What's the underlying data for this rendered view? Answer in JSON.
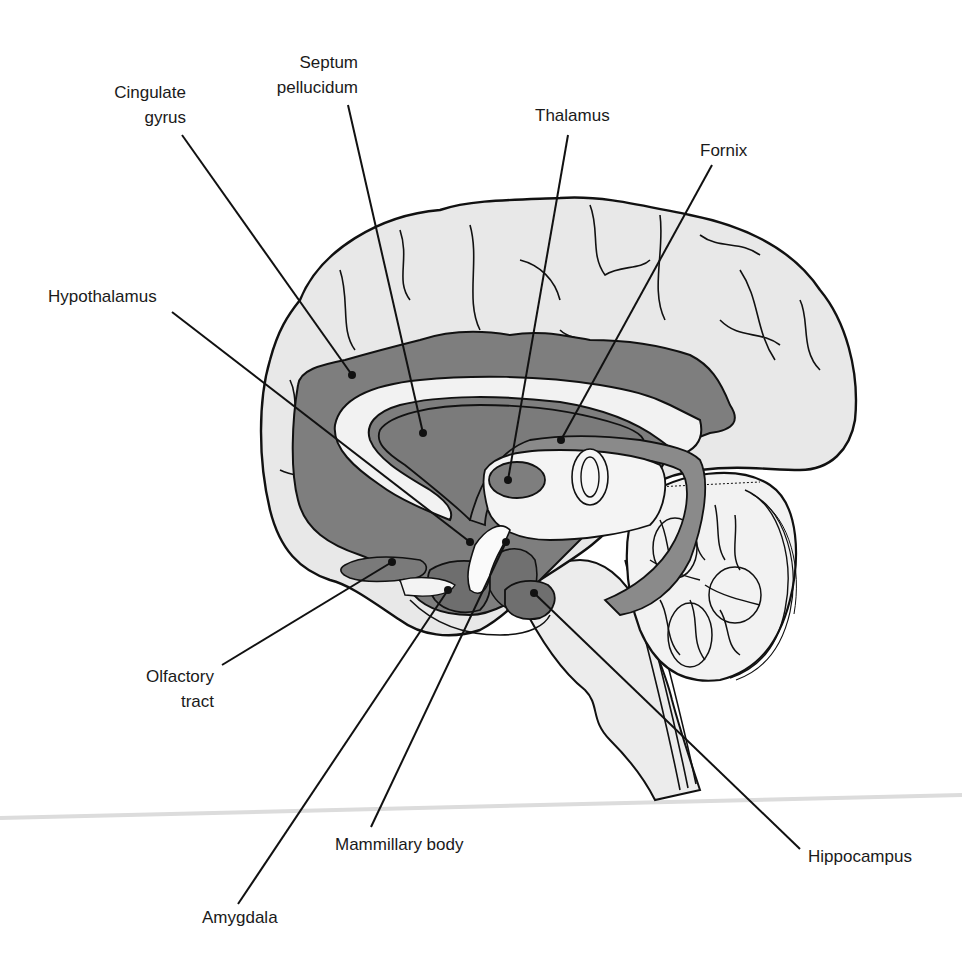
{
  "diagram": {
    "colors": {
      "cortex_fill": "#e6e6e6",
      "limbic_fill": "#7d7d7d",
      "limbic_dark": "#6a6a6a",
      "light_band": "#f2f2f2",
      "stroke": "#111111",
      "cerebellum_fill": "#f0f0f0",
      "brainstem_fill": "#ebebeb",
      "rule_line": "#d9d9d9"
    },
    "labels": {
      "cingulate_gyrus": {
        "line1": "Cingulate",
        "line2": "gyrus"
      },
      "septum_pellucidum": {
        "line1": "Septum",
        "line2": "pellucidum"
      },
      "thalamus": {
        "line1": "Thalamus"
      },
      "fornix": {
        "line1": "Fornix"
      },
      "hypothalamus": {
        "line1": "Hypothalamus"
      },
      "olfactory_tract": {
        "line1": "Olfactory",
        "line2": "tract"
      },
      "mammillary_body": {
        "line1": "Mammillary body"
      },
      "amygdala": {
        "line1": "Amygdala"
      },
      "hippocampus": {
        "line1": "Hippocampus"
      }
    }
  }
}
